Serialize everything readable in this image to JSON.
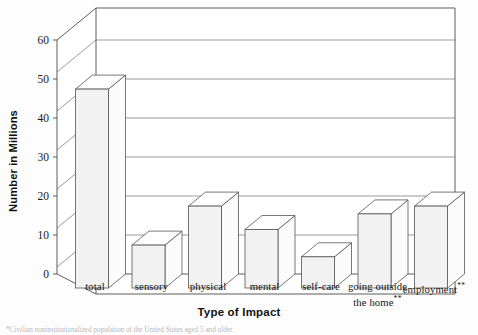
{
  "chart_data": {
    "type": "bar",
    "title": "",
    "xlabel": "Type of Impact",
    "ylabel": "Number in Millions",
    "categories": [
      "total",
      "sensory",
      "physical",
      "mental",
      "self-care",
      "going outside the home**",
      "employment**"
    ],
    "category_lines": [
      [
        "total"
      ],
      [
        "sensory"
      ],
      [
        "physical"
      ],
      [
        "mental"
      ],
      [
        "self-care"
      ],
      [
        "going outside",
        "the home**"
      ],
      [
        "employment**"
      ]
    ],
    "values": [
      51,
      11,
      21,
      15,
      8,
      19,
      21
    ],
    "ylim": [
      0,
      60
    ],
    "yticks": [
      0,
      10,
      20,
      30,
      40,
      50,
      60
    ],
    "ytick_labels": [
      "0",
      "10",
      "20",
      "30",
      "40",
      "50",
      "60"
    ],
    "grid": true,
    "grid_axis": "y",
    "legend": false,
    "style": "3d-column",
    "series": [
      {
        "name": "Number in Millions",
        "values": [
          51,
          11,
          21,
          15,
          8,
          19,
          21
        ]
      }
    ]
  },
  "axes": {
    "x_title": "Type of Impact",
    "y_title": "Number in Millions"
  },
  "footnote": {
    "text": "*Civilian noninstitutionalized population of the United States aged 5 and older."
  },
  "colors": {
    "bar_front": "#f2f2f2",
    "bar_side": "#fbfbfb",
    "bar_top": "#ffffff",
    "bar_stroke": "#555555",
    "grid": "#6e6e6e",
    "axis": "#4a4a4a",
    "text": "#1a1a1a",
    "background": "#fdfdfd"
  }
}
